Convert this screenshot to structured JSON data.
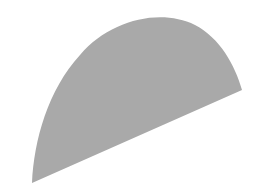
{
  "diagram": {
    "shape": "circular-segment",
    "fill_color": "#a9a9a9",
    "background_color": "#ffffff"
  }
}
